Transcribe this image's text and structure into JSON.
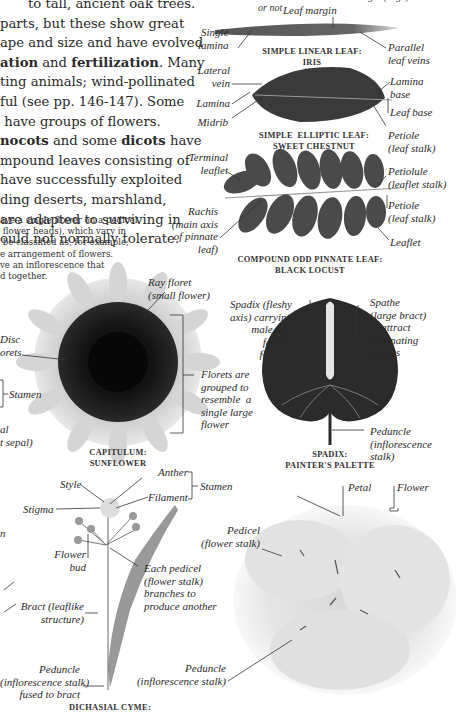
{
  "body_paragraph": {
    "lines": [
      "to tall, ancient oak trees.",
      "parts, but these show great",
      "ape and size and have evolved",
      "ation",
      " and ",
      "fertilization",
      ". Many",
      "ting animals; wind-pollinated",
      "ful (see pp. 146-147). Some",
      " have groups of flowers.",
      "nocots",
      " and some ",
      "dicots",
      " have",
      "mpound leaves consisting of",
      "have successfully exploited",
      "ding deserts, marshland,",
      "are adapted to surviving in",
      "ould not normally tolerate."
    ]
  },
  "small_paragraph": {
    "lines": [
      "ave a single flower on a pedicel",
      " flower heads), which vary in",
      " be classified as, for example,",
      "e arrangement of flowers.",
      "ve an inflorescence that",
      "d together."
    ]
  },
  "top_fragment": "lamina and whether its margin (edge) is smooth or not",
  "leaves": {
    "linear": {
      "labels": {
        "leaf_margin": "Leaf margin",
        "single_lamina": "Single\nlamina",
        "parallel_veins": "Parallel\nleaf veins"
      },
      "caption": [
        "SIMPLE LINEAR LEAF:",
        "IRIS"
      ]
    },
    "elliptic": {
      "labels": {
        "lateral_vein": "Lateral\nvein",
        "lamina": "Lamina",
        "midrib": "Midrib",
        "lamina_base": "Lamina\nbase",
        "leaf_base": "Leaf base",
        "petiole": "Petiole\n(leaf stalk)"
      },
      "caption": [
        "SIMPLE  ELLIPTIC LEAF:",
        "SWEET CHESTNUT"
      ]
    },
    "pinnate": {
      "labels": {
        "terminal_leaflet": "Terminal\nleaflet",
        "rachis": "Rachis\n(main axis\nof pinnate\nleaf)",
        "petiolule": "Petiolule\n(leaflet stalk)",
        "petiole": "Petiole\n(leaf stalk)",
        "leaflet": "Leaflet"
      },
      "caption": [
        "COMPOUND ODD PINNATE LEAF:",
        "BLACK LOCUST"
      ]
    }
  },
  "inflorescences": {
    "capitulum": {
      "labels": {
        "ray_floret": "Ray floret\n(small flower)",
        "disc_florets": "Disc\norets",
        "florets_grouped": "Florets are\ngrouped to\nresemble  a\nsingle large\nflower"
      },
      "caption": [
        "CAPITULUM:",
        "SUNFLOWER"
      ]
    },
    "spadix": {
      "labels": {
        "spadix": "Spadix (fleshy\naxis) carrying\nmale and\nfemale\nflowers",
        "spathe": "Spathe\n(large bract)\nto attract\npollinating\ninsects",
        "peduncle": "Peduncle\n(inflorescence\nstalk)"
      },
      "caption": [
        "SPADIX:",
        "PAINTER'S PALETTE"
      ]
    },
    "cyme": {
      "labels": {
        "style": "Style",
        "anther": "Anther",
        "stamen": "Stamen",
        "stigma": "Stigma",
        "filament": "Filament",
        "flower_bud": "Flower\nbud",
        "each_pedicel": "Each pedicel\n(flower stalk)\nbranches to\nproduce another",
        "bract": "Bract (leaflike\nstructure)",
        "peduncle": "Peduncle\n(inflorescence stalk)\nfused to bract"
      },
      "caption": [
        "DICHASIAL CYME:"
      ]
    },
    "umbel_like": {
      "labels": {
        "petal": "Petal",
        "flower": "Flower",
        "pedicel": "Pedicel\n(flower stalk)",
        "peduncle": "Peduncle\n(inflorescence stalk)"
      }
    }
  },
  "left_edge_fragments": {
    "stamen": "Stamen",
    "sepal": "al\nt sepal)",
    "n": "n"
  }
}
